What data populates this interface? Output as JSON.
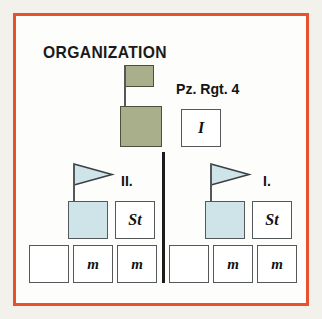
{
  "diagram": {
    "title": "ORGANIZATION",
    "frame_color": "#e8502e",
    "background_color": "#f3f1ec",
    "panel_color": "#fdfdfb",
    "regiment": {
      "label": "Pz. Rgt. 4",
      "symbol_color": "#a9ae8b",
      "flag_type": "rectangular-standard",
      "staff_box_label": "I"
    },
    "battalions": [
      {
        "label": "II.",
        "symbol_color": "#cfe4e8",
        "flag_type": "triangular-pennant",
        "staff_box_label": "St",
        "companies": [
          {
            "label": ""
          },
          {
            "label": "m"
          },
          {
            "label": "m"
          }
        ]
      },
      {
        "label": "I.",
        "symbol_color": "#cfe4e8",
        "flag_type": "triangular-pennant",
        "staff_box_label": "St",
        "companies": [
          {
            "label": ""
          },
          {
            "label": "m"
          },
          {
            "label": "m"
          }
        ]
      }
    ],
    "divider": {
      "orientation": "vertical",
      "color": "#1b1b1b"
    }
  }
}
